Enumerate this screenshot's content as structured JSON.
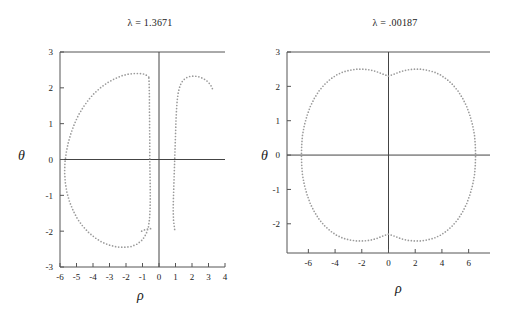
{
  "figure": {
    "background_color": "#ffffff",
    "dot_color": "#9a9a9a",
    "axis_color": "#555555"
  },
  "panels": [
    {
      "id": "left-panel",
      "title": "λ = 1.3671",
      "xlabel": "ρ",
      "ylabel": "θ",
      "xticks": [
        -6,
        -5,
        -4,
        -3,
        -2,
        -1,
        0,
        1,
        2,
        3,
        4
      ],
      "xtick_labels": [
        "-6",
        "-5",
        "-4",
        "-3",
        "-2",
        "-1",
        "0",
        "1",
        "2",
        "3",
        "4"
      ],
      "yticks": [
        -3,
        -2,
        -1,
        0,
        1,
        2,
        3
      ],
      "ytick_labels": [
        "-3",
        "-2",
        "-1",
        "0",
        "1",
        "2",
        "3"
      ],
      "xlim": [
        -6,
        4
      ],
      "ylim": [
        -3,
        3
      ]
    },
    {
      "id": "right-panel",
      "title": "λ = .00187",
      "xlabel": "ρ",
      "ylabel": "θ",
      "xticks": [
        -6,
        -4,
        -2,
        0,
        2,
        4,
        6
      ],
      "xtick_labels": [
        "-6",
        "-4",
        "-2",
        "0",
        "2",
        "4",
        "6"
      ],
      "yticks": [
        -2,
        -1,
        0,
        1,
        2,
        3
      ],
      "ytick_labels": [
        "-2",
        "-1",
        "0",
        "1",
        "2",
        "3"
      ],
      "xlim": [
        -7.6,
        7.6
      ],
      "ylim": [
        -2.85,
        3
      ]
    }
  ],
  "chart_data": [
    {
      "type": "scatter",
      "title": "λ = 1.3671",
      "xlabel": "ρ",
      "ylabel": "θ",
      "xlim": [
        -6,
        4
      ],
      "ylim": [
        -3,
        3
      ],
      "grid": false,
      "legend": "none",
      "series": [
        {
          "name": "left-lobe",
          "comment": "large closed lobe spanning rho -5.75..-0.45, theta -2.45..2.4",
          "closed": true,
          "points": [
            [
              -0.62,
              2.3
            ],
            [
              -0.85,
              2.38
            ],
            [
              -1.15,
              2.4
            ],
            [
              -1.5,
              2.4
            ],
            [
              -1.9,
              2.38
            ],
            [
              -2.3,
              2.33
            ],
            [
              -2.7,
              2.25
            ],
            [
              -3.1,
              2.15
            ],
            [
              -3.5,
              2.02
            ],
            [
              -3.9,
              1.86
            ],
            [
              -4.25,
              1.68
            ],
            [
              -4.58,
              1.47
            ],
            [
              -4.88,
              1.24
            ],
            [
              -5.12,
              1.0
            ],
            [
              -5.33,
              0.74
            ],
            [
              -5.5,
              0.47
            ],
            [
              -5.62,
              0.2
            ],
            [
              -5.7,
              -0.08
            ],
            [
              -5.72,
              -0.36
            ],
            [
              -5.68,
              -0.64
            ],
            [
              -5.58,
              -0.92
            ],
            [
              -5.42,
              -1.18
            ],
            [
              -5.2,
              -1.43
            ],
            [
              -4.94,
              -1.66
            ],
            [
              -4.62,
              -1.86
            ],
            [
              -4.26,
              -2.04
            ],
            [
              -3.86,
              -2.19
            ],
            [
              -3.44,
              -2.31
            ],
            [
              -3.0,
              -2.39
            ],
            [
              -2.56,
              -2.44
            ],
            [
              -2.12,
              -2.45
            ],
            [
              -1.7,
              -2.43
            ],
            [
              -1.32,
              -2.36
            ],
            [
              -1.0,
              -2.24
            ],
            [
              -0.78,
              -2.08
            ],
            [
              -0.64,
              -1.88
            ],
            [
              -0.57,
              -1.64
            ],
            [
              -0.54,
              -1.38
            ],
            [
              -0.53,
              -1.1
            ],
            [
              -0.53,
              -0.82
            ],
            [
              -0.54,
              -0.54
            ],
            [
              -0.55,
              -0.26
            ],
            [
              -0.56,
              0.02
            ],
            [
              -0.56,
              0.3
            ],
            [
              -0.56,
              0.58
            ],
            [
              -0.57,
              0.86
            ],
            [
              -0.57,
              1.14
            ],
            [
              -0.58,
              1.42
            ],
            [
              -0.58,
              1.7
            ],
            [
              -0.59,
              1.98
            ],
            [
              -0.6,
              2.16
            ]
          ]
        },
        {
          "name": "right-lobe",
          "comment": "narrow arch open at bottom, rho 0.85..3.25, top near theta 2.3",
          "closed": false,
          "points": [
            [
              0.95,
              -1.95
            ],
            [
              0.88,
              -1.7
            ],
            [
              0.86,
              -1.42
            ],
            [
              0.87,
              -1.14
            ],
            [
              0.89,
              -0.86
            ],
            [
              0.91,
              -0.58
            ],
            [
              0.93,
              -0.3
            ],
            [
              0.95,
              -0.02
            ],
            [
              0.97,
              0.26
            ],
            [
              0.99,
              0.54
            ],
            [
              1.01,
              0.82
            ],
            [
              1.03,
              1.1
            ],
            [
              1.06,
              1.38
            ],
            [
              1.1,
              1.64
            ],
            [
              1.17,
              1.88
            ],
            [
              1.28,
              2.07
            ],
            [
              1.44,
              2.2
            ],
            [
              1.64,
              2.28
            ],
            [
              1.88,
              2.32
            ],
            [
              2.14,
              2.33
            ],
            [
              2.4,
              2.31
            ],
            [
              2.64,
              2.27
            ],
            [
              2.86,
              2.21
            ],
            [
              3.04,
              2.13
            ],
            [
              3.18,
              2.04
            ],
            [
              3.26,
              1.95
            ]
          ]
        },
        {
          "name": "lower-tail",
          "comment": "short dotted tail near rho -0.5, theta -1.95",
          "closed": false,
          "points": [
            [
              -1.05,
              -2.0
            ],
            [
              -0.86,
              -1.96
            ],
            [
              -0.7,
              -1.94
            ],
            [
              -0.56,
              -1.93
            ],
            [
              -0.44,
              -1.93
            ]
          ]
        }
      ]
    },
    {
      "type": "scatter",
      "title": "λ = .00187",
      "xlabel": "ρ",
      "ylabel": "θ",
      "xlim": [
        -7.6,
        7.6
      ],
      "ylim": [
        -2.85,
        3
      ],
      "grid": false,
      "legend": "none",
      "series": [
        {
          "name": "closed-oval",
          "comment": "symmetric closed oval, rho -6.5..6.5, theta -2.5..2.5, with dimples at rho=0 top and bottom reaching |theta|=2.3",
          "closed": true,
          "dimple_top_theta": 2.3,
          "dimple_peak_theta": 2.5,
          "dimple_peak_rho": 2.1,
          "points": [
            [
              0.0,
              2.3
            ],
            [
              0.45,
              2.36
            ],
            [
              0.9,
              2.43
            ],
            [
              1.4,
              2.48
            ],
            [
              1.9,
              2.5
            ],
            [
              2.4,
              2.5
            ],
            [
              2.9,
              2.47
            ],
            [
              3.4,
              2.42
            ],
            [
              3.9,
              2.33
            ],
            [
              4.35,
              2.21
            ],
            [
              4.78,
              2.06
            ],
            [
              5.18,
              1.88
            ],
            [
              5.54,
              1.66
            ],
            [
              5.85,
              1.42
            ],
            [
              6.1,
              1.15
            ],
            [
              6.3,
              0.87
            ],
            [
              6.44,
              0.58
            ],
            [
              6.5,
              0.29
            ],
            [
              6.52,
              0.0
            ],
            [
              6.5,
              -0.29
            ],
            [
              6.44,
              -0.58
            ],
            [
              6.3,
              -0.87
            ],
            [
              6.1,
              -1.15
            ],
            [
              5.85,
              -1.42
            ],
            [
              5.54,
              -1.66
            ],
            [
              5.18,
              -1.88
            ],
            [
              4.78,
              -2.06
            ],
            [
              4.35,
              -2.21
            ],
            [
              3.9,
              -2.33
            ],
            [
              3.4,
              -2.42
            ],
            [
              2.9,
              -2.47
            ],
            [
              2.4,
              -2.5
            ],
            [
              1.9,
              -2.5
            ],
            [
              1.4,
              -2.48
            ],
            [
              0.9,
              -2.43
            ],
            [
              0.45,
              -2.36
            ],
            [
              0.0,
              -2.3
            ],
            [
              -0.45,
              -2.36
            ],
            [
              -0.9,
              -2.43
            ],
            [
              -1.4,
              -2.48
            ],
            [
              -1.9,
              -2.5
            ],
            [
              -2.4,
              -2.5
            ],
            [
              -2.9,
              -2.47
            ],
            [
              -3.4,
              -2.42
            ],
            [
              -3.9,
              -2.33
            ],
            [
              -4.35,
              -2.21
            ],
            [
              -4.78,
              -2.06
            ],
            [
              -5.18,
              -1.88
            ],
            [
              -5.54,
              -1.66
            ],
            [
              -5.85,
              -1.42
            ],
            [
              -6.1,
              -1.15
            ],
            [
              -6.3,
              -0.87
            ],
            [
              -6.44,
              -0.58
            ],
            [
              -6.5,
              -0.29
            ],
            [
              -6.52,
              0.0
            ],
            [
              -6.5,
              0.29
            ],
            [
              -6.44,
              0.58
            ],
            [
              -6.3,
              0.87
            ],
            [
              -6.1,
              1.15
            ],
            [
              -5.85,
              1.42
            ],
            [
              -5.54,
              1.66
            ],
            [
              -5.18,
              1.88
            ],
            [
              -4.78,
              2.06
            ],
            [
              -4.35,
              2.21
            ],
            [
              -3.9,
              2.33
            ],
            [
              -3.4,
              2.42
            ],
            [
              -2.9,
              2.47
            ],
            [
              -2.4,
              2.5
            ],
            [
              -1.9,
              2.5
            ],
            [
              -1.4,
              2.48
            ],
            [
              -0.9,
              2.43
            ],
            [
              -0.45,
              2.36
            ]
          ]
        }
      ]
    }
  ]
}
